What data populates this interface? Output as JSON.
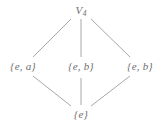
{
  "figure": {
    "kind": "hasse-diagram",
    "background_color": "#ffffff",
    "edge_color": "#a8a8a8",
    "text_color": "#6e6e6e"
  },
  "nodes": {
    "top": {
      "id": "v4",
      "base": "V",
      "subscript": "4",
      "x": 81,
      "y": 10
    },
    "left": {
      "id": "e-a",
      "label": "{e, a}",
      "x": 23,
      "y": 66
    },
    "middle": {
      "id": "e-b-middle",
      "label": "{e, b}",
      "x": 81,
      "y": 66
    },
    "right": {
      "id": "e-b-right",
      "label": "{e, b}",
      "x": 140,
      "y": 66
    },
    "bottom": {
      "id": "e",
      "label": "{e}",
      "x": 81,
      "y": 114
    }
  },
  "edges": [
    {
      "id": "top-left",
      "from": "v4",
      "to": "e-a",
      "x1": 71,
      "y1": 19,
      "x2": 33,
      "y2": 57
    },
    {
      "id": "top-middle",
      "from": "v4",
      "to": "e-b-middle",
      "x1": 81,
      "y1": 19,
      "x2": 81,
      "y2": 57
    },
    {
      "id": "top-right",
      "from": "v4",
      "to": "e-b-right",
      "x1": 91,
      "y1": 19,
      "x2": 130,
      "y2": 57
    },
    {
      "id": "left-bottom",
      "from": "e-a",
      "to": "e",
      "x1": 33,
      "y1": 76,
      "x2": 71,
      "y2": 106
    },
    {
      "id": "middle-bottom",
      "from": "e-b-middle",
      "to": "e",
      "x1": 81,
      "y1": 78,
      "x2": 81,
      "y2": 105
    },
    {
      "id": "right-bottom",
      "from": "e-b-right",
      "to": "e",
      "x1": 130,
      "y1": 76,
      "x2": 91,
      "y2": 106
    }
  ]
}
